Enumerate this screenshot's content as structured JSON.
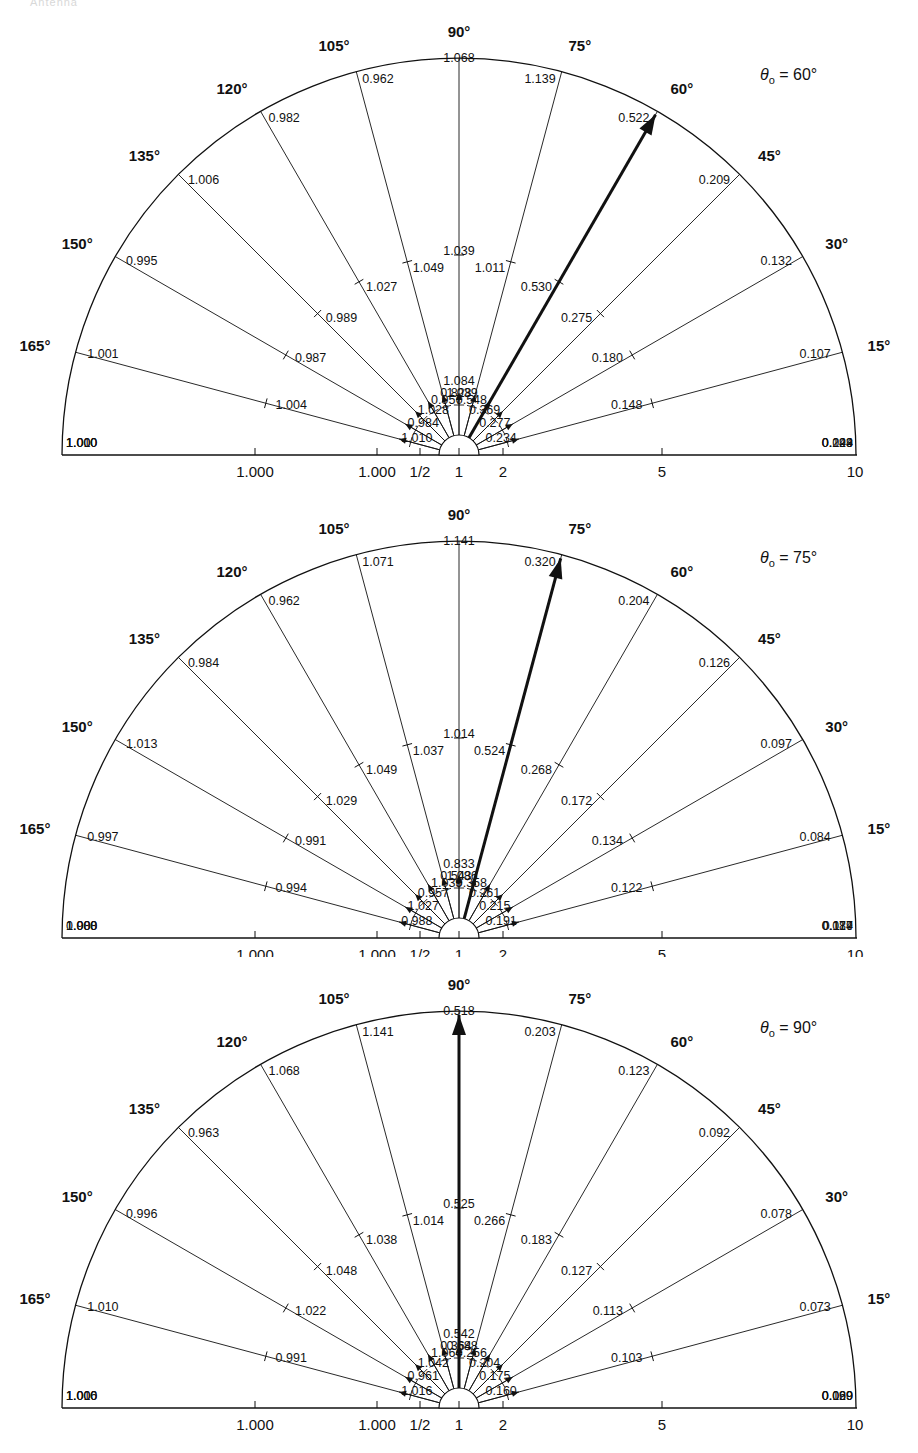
{
  "figure": {
    "header_faint": "Antenna",
    "panel_count": 3
  },
  "axis": {
    "ticks": [
      {
        "label": "1.000",
        "x": 255
      },
      {
        "label": "1.000",
        "x": 377
      },
      {
        "label": "1/2",
        "x": 420
      },
      {
        "label": "1",
        "x": 459
      },
      {
        "label": "2",
        "x": 503
      },
      {
        "label": "5",
        "x": 662
      },
      {
        "label": "10",
        "x": 855
      }
    ],
    "angle_labels": [
      "15°",
      "30°",
      "45°",
      "60°",
      "75°",
      "90°",
      "105°",
      "120°",
      "135°",
      "150°",
      "165°"
    ]
  },
  "chart_data": [
    {
      "type": "polar",
      "title": "θ0 = 60°",
      "theta0_label": "θ",
      "theta0_sub": "o",
      "theta0_value": "= 60°",
      "arrow_angle": 60,
      "outer_values": {
        "0": "0.099",
        "15": "0.107",
        "30": "0.132",
        "45": "0.209",
        "60": "0.522",
        "75": "1.139",
        "90": "1.068",
        "105": "0.962",
        "120": "0.982",
        "135": "1.006",
        "150": "0.995",
        "165": "1.001",
        "180": "1.000"
      },
      "mid_values": {
        "0": "0.144",
        "15": "0.148",
        "30": "0.180",
        "45": "0.275",
        "60": "0.530",
        "75": "1.011",
        "90": "1.039",
        "105": "1.049",
        "120": "1.027",
        "135": "0.989",
        "150": "0.987",
        "165": "1.004",
        "180": "1.010"
      },
      "inner_values": {
        "0": "0.223",
        "15": "0.234",
        "30": "0.277",
        "45": "0.369",
        "60": "0.548",
        "75": "0.828",
        "90": "1.084",
        "105": "1.039",
        "120": "0.957",
        "135": "1.028",
        "150": "0.984",
        "165": "1.010",
        "180": "1.000"
      }
    },
    {
      "type": "polar",
      "title": "θ0 = 75°",
      "theta0_label": "θ",
      "theta0_sub": "o",
      "theta0_value": "= 75°",
      "arrow_angle": 75,
      "outer_values": {
        "0": "0.084",
        "15": "0.084",
        "30": "0.097",
        "45": "0.126",
        "60": "0.204",
        "75": "0.320",
        "90": "1.141",
        "105": "1.071",
        "120": "0.962",
        "135": "0.984",
        "150": "1.013",
        "165": "0.997",
        "180": "1.000"
      },
      "mid_values": {
        "0": "0.117",
        "15": "0.122",
        "30": "0.134",
        "45": "0.172",
        "60": "0.268",
        "75": "0.524",
        "90": "1.014",
        "105": "1.037",
        "120": "1.049",
        "135": "1.029",
        "150": "0.991",
        "165": "0.994",
        "180": "0.988"
      },
      "inner_values": {
        "0": "0.179",
        "15": "0.191",
        "30": "0.215",
        "45": "0.261",
        "60": "0.358",
        "75": "0.543",
        "90": "0.833",
        "105": "1.086",
        "120": "1.039",
        "135": "0.957",
        "150": "1.027",
        "165": "0.988",
        "180": "1.000"
      }
    },
    {
      "type": "polar",
      "title": "θ0 = 90°",
      "theta0_label": "θ",
      "theta0_sub": "o",
      "theta0_value": "= 90°",
      "arrow_angle": 90,
      "outer_values": {
        "0": "0.069",
        "15": "0.073",
        "30": "0.078",
        "45": "0.092",
        "60": "0.123",
        "75": "0.203",
        "90": "0.518",
        "105": "1.141",
        "120": "1.068",
        "135": "0.963",
        "150": "0.996",
        "165": "1.010",
        "180": "1.000"
      },
      "mid_values": {
        "0": "0.099",
        "15": "0.103",
        "30": "0.113",
        "45": "0.127",
        "60": "0.183",
        "75": "0.266",
        "90": "0.525",
        "105": "1.014",
        "120": "1.038",
        "135": "1.048",
        "150": "1.022",
        "165": "0.991",
        "180": "1.016"
      },
      "inner_values": {
        "0": "0.120",
        "15": "0.160",
        "30": "0.175",
        "45": "0.204",
        "60": "0.256",
        "75": "0.364",
        "90": "0.542",
        "105": "0.688",
        "120": "1.064",
        "135": "1.042",
        "150": "0.961",
        "165": "1.016",
        "180": "1.000"
      }
    }
  ]
}
